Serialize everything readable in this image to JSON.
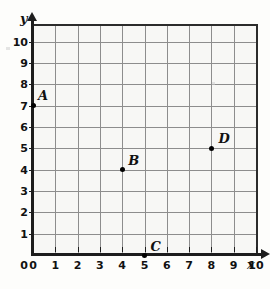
{
  "chart_data": {
    "type": "scatter",
    "title": "",
    "xlabel": "x",
    "ylabel": "y",
    "xlim": [
      0,
      10
    ],
    "ylim": [
      0,
      10.5
    ],
    "grid": true,
    "legend": "none",
    "x_ticks": [
      "0",
      "1",
      "2",
      "3",
      "4",
      "5",
      "6",
      "7",
      "8",
      "9",
      "10"
    ],
    "y_ticks": [
      "1",
      "2",
      "3",
      "4",
      "5",
      "6",
      "7",
      "8",
      "9",
      "10"
    ],
    "points": [
      {
        "label": "A",
        "x": 0,
        "y": 7
      },
      {
        "label": "B",
        "x": 4,
        "y": 4
      },
      {
        "label": "C",
        "x": 5,
        "y": 0
      },
      {
        "label": "D",
        "x": 8,
        "y": 5
      }
    ]
  },
  "axes": {
    "x_name": "x",
    "y_name": "y",
    "origin_label": "0"
  },
  "colors": {
    "background": "#fdfdfb",
    "plot_background": "#f7f7f5",
    "gridline": "#8d8d8d",
    "axis": "#1d1d1d",
    "point": "#000000",
    "text": "#111111"
  }
}
